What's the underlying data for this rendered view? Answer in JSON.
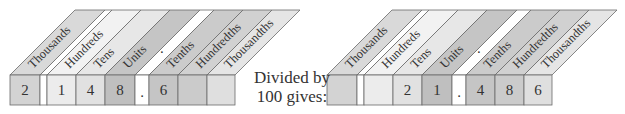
{
  "diagram": {
    "middle_text": {
      "line1": "Divided by",
      "line2": "100 gives:"
    },
    "column_labels": [
      "Thousands",
      "",
      "Hundreds",
      "Tens",
      "Units",
      ".",
      "Tenths",
      "Hundredths",
      "Thousandths"
    ],
    "before": {
      "digits": [
        "2",
        "",
        "1",
        "4",
        "8",
        ".",
        "6",
        "",
        ""
      ]
    },
    "after": {
      "digits": [
        "",
        "",
        "",
        "2",
        "1",
        ".",
        "4",
        "8",
        "6"
      ]
    },
    "colors": {
      "thousands": "#d3d3d3",
      "gap": "#ffffff",
      "hundreds": "#ececec",
      "tens": "#e1e1e1",
      "units": "#bfbfbf",
      "point": "#ffffff",
      "tenths": "#c5c5c5",
      "hundredths": "#cbcbcb",
      "thousandths": "#dfdfdf",
      "edge": "#6a6a6a"
    }
  }
}
